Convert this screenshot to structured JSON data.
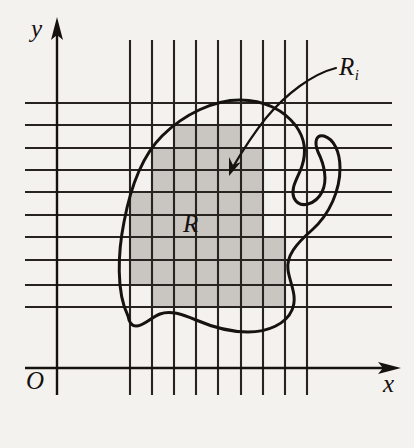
{
  "figure": {
    "name": "region-partition-diagram",
    "background_color": "#f4f2ef",
    "ink_color": "#16130f",
    "cell_fill_color": "#c9c6c2",
    "width": 414,
    "height": 448
  },
  "labels": {
    "y_axis": "y",
    "x_axis": "x",
    "origin": "O",
    "region": "R",
    "subregion_base": "R",
    "subregion_index": "i"
  },
  "axes": {
    "y_axis": {
      "x": 57,
      "y_top": 18,
      "y_bottom": 395
    },
    "x_axis": {
      "y": 368,
      "x_left": 25,
      "x_right": 400
    }
  },
  "grid": {
    "vertical_x": [
      130,
      152,
      174,
      196,
      218,
      241,
      263,
      285,
      307
    ],
    "vertical_y_top": 40,
    "vertical_y_bottom": 395,
    "horizontal_y": [
      103,
      125,
      148,
      170,
      192,
      215,
      237,
      260,
      285,
      307
    ],
    "horizontal_x_left": 25,
    "horizontal_x_right": 392,
    "cell_width": 22,
    "cell_height": 22.5
  },
  "shaded_cells": [
    {
      "x": 174,
      "y": 125,
      "w": 67,
      "h": 23
    },
    {
      "x": 152,
      "y": 148,
      "w": 111,
      "h": 22
    },
    {
      "x": 152,
      "y": 170,
      "w": 111,
      "h": 22
    },
    {
      "x": 130,
      "y": 192,
      "w": 133,
      "h": 23
    },
    {
      "x": 130,
      "y": 215,
      "w": 133,
      "h": 22
    },
    {
      "x": 130,
      "y": 237,
      "w": 155,
      "h": 23
    },
    {
      "x": 130,
      "y": 260,
      "w": 155,
      "h": 25
    },
    {
      "x": 152,
      "y": 285,
      "w": 133,
      "h": 22
    }
  ],
  "region_curve": {
    "description": "closed irregular blob boundary of region R",
    "path": "M 128 316 C 116 292 118 252 124 222 C 130 190 140 158 162 136 C 184 114 214 100 240 100 C 264 100 284 110 296 126 C 306 140 306 154 302 166 C 298 178 290 188 294 198 C 300 210 316 204 322 192 C 328 180 324 164 318 152 C 314 142 316 134 324 136 C 334 139 340 152 340 168 C 340 190 330 214 312 230 C 296 244 286 256 288 270 C 290 284 298 296 292 310 C 286 324 268 332 248 332 C 228 332 210 326 196 320 C 182 314 170 310 160 314 C 150 318 144 326 136 326 C 131 326 129 322 128 316 Z"
  },
  "pointer": {
    "description": "curved arrow from the R-sub-i label to a shaded grid cell",
    "path": "M 336 68 C 312 74 286 94 266 118 C 250 138 240 155 232 168",
    "arrow_tip": {
      "x": 229,
      "y": 174
    }
  }
}
